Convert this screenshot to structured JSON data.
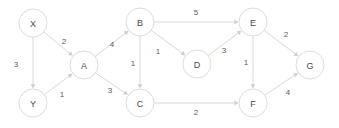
{
  "diagram": {
    "type": "directed-weighted-graph",
    "title": "",
    "style": {
      "node_fill": "#ffffff",
      "node_stroke": "#dcdcdc",
      "edge_color": "#d8d8d8",
      "label_color": "#4a4a4a",
      "weight_color": "#5a5a5a",
      "background": "#ffffff"
    },
    "nodes": [
      {
        "id": "X",
        "label": "X",
        "cx": 33,
        "cy": 23,
        "r": 14
      },
      {
        "id": "Y",
        "label": "Y",
        "cx": 33,
        "cy": 103,
        "r": 14
      },
      {
        "id": "A",
        "label": "A",
        "cx": 84,
        "cy": 65,
        "r": 14
      },
      {
        "id": "B",
        "label": "B",
        "cx": 140,
        "cy": 22,
        "r": 14
      },
      {
        "id": "C",
        "label": "C",
        "cx": 140,
        "cy": 103,
        "r": 14
      },
      {
        "id": "D",
        "label": "D",
        "cx": 197,
        "cy": 64,
        "r": 14
      },
      {
        "id": "E",
        "label": "E",
        "cx": 253,
        "cy": 22,
        "r": 14
      },
      {
        "id": "F",
        "label": "F",
        "cx": 253,
        "cy": 103,
        "r": 14
      },
      {
        "id": "G",
        "label": "G",
        "cx": 310,
        "cy": 65,
        "r": 14
      }
    ],
    "edges": [
      {
        "from": "X",
        "to": "Y",
        "weight": "3",
        "label_x": 16,
        "label_y": 64
      },
      {
        "from": "X",
        "to": "A",
        "weight": "2",
        "label_x": 64,
        "label_y": 41
      },
      {
        "from": "Y",
        "to": "A",
        "weight": "1",
        "label_x": 62,
        "label_y": 94
      },
      {
        "from": "A",
        "to": "B",
        "weight": "4",
        "label_x": 112,
        "label_y": 44
      },
      {
        "from": "B",
        "to": "C",
        "weight": "1",
        "label_x": 133,
        "label_y": 63
      },
      {
        "from": "A",
        "to": "C",
        "weight": "3",
        "label_x": 110,
        "label_y": 90
      },
      {
        "from": "B",
        "to": "E",
        "weight": "5",
        "label_x": 196,
        "label_y": 12
      },
      {
        "from": "B",
        "to": "D",
        "weight": "1",
        "label_x": 158,
        "label_y": 51
      },
      {
        "from": "D",
        "to": "E",
        "weight": "3",
        "label_x": 224,
        "label_y": 50
      },
      {
        "from": "C",
        "to": "F",
        "weight": "2",
        "label_x": 196,
        "label_y": 112
      },
      {
        "from": "E",
        "to": "F",
        "weight": "1",
        "label_x": 246,
        "label_y": 62
      },
      {
        "from": "E",
        "to": "G",
        "weight": "2",
        "label_x": 286,
        "label_y": 34
      },
      {
        "from": "F",
        "to": "G",
        "weight": "4",
        "label_x": 288,
        "label_y": 92
      }
    ]
  }
}
